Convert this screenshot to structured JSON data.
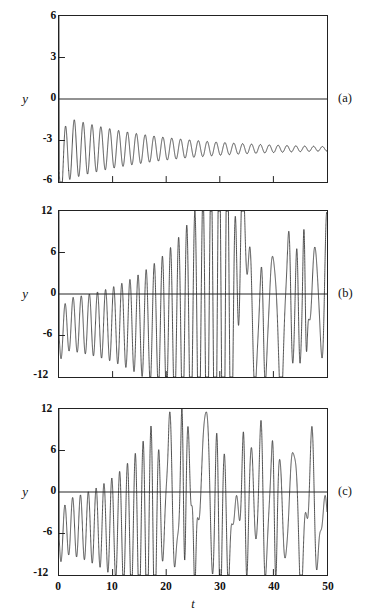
{
  "figure": {
    "background": "#ffffff",
    "line_color": "#222222",
    "axis_color": "#222222",
    "xlabel": "t",
    "ylabel": "y"
  },
  "panels": [
    {
      "letter": "(a)",
      "ylabel": "y",
      "yticks": [
        "6",
        "3",
        "0",
        "-3",
        "-6"
      ],
      "ytick_values": [
        6,
        3,
        0,
        -3,
        -6
      ],
      "ylim": [
        -6,
        6
      ],
      "xlim": [
        0,
        50
      ],
      "xticks_minor": [
        10,
        20,
        30,
        40
      ],
      "show_xticklabels": false
    },
    {
      "letter": "(b)",
      "ylabel": "y",
      "yticks": [
        "12",
        "6",
        "0",
        "-6",
        "-12"
      ],
      "ytick_values": [
        12,
        6,
        0,
        -6,
        -12
      ],
      "ylim": [
        -12,
        12
      ],
      "xlim": [
        0,
        50
      ],
      "xticks_minor": [
        10,
        20,
        30,
        40
      ],
      "show_xticklabels": false
    },
    {
      "letter": "(c)",
      "ylabel": "y",
      "yticks": [
        "12",
        "6",
        "0",
        "-6",
        "-12"
      ],
      "ytick_values": [
        12,
        6,
        0,
        -6,
        -12
      ],
      "ylim": [
        -12,
        12
      ],
      "xlim": [
        0,
        50
      ],
      "xticks": [
        "0",
        "10",
        "20",
        "30",
        "40",
        "50"
      ],
      "xtick_values": [
        0,
        10,
        20,
        30,
        40,
        50
      ],
      "show_xticklabels": true
    }
  ],
  "chart_data": [
    {
      "type": "line",
      "title": "",
      "subtitle": "(a)",
      "xlabel": "",
      "ylabel": "y",
      "xlim": [
        0,
        50
      ],
      "ylim": [
        -6,
        6
      ],
      "grid": false,
      "legend": null,
      "series": [
        {
          "name": "y(t) damped oscillation",
          "description": "Starts at y=6 at t=0, drops sharply, then oscillates about a mean near -3.6 with amplitude decaying from about 2.6 to 0.3 by t=50; period about 1.65",
          "model": {
            "form": "offset + amp0*exp(-k*t)*sin(omega*t + phase)",
            "offset": -3.6,
            "amp0": 2.45,
            "decay_k": 0.055,
            "omega": 3.8,
            "phase": 3.3,
            "initial_spike_y": 6.0,
            "initial_spike_t": 0.05
          }
        }
      ]
    },
    {
      "type": "line",
      "title": "",
      "subtitle": "(b)",
      "xlabel": "",
      "ylabel": "y",
      "xlim": [
        0,
        50
      ],
      "ylim": [
        -12,
        12
      ],
      "grid": false,
      "legend": null,
      "series": [
        {
          "name": "y(t) slowly growing then bursting oscillation",
          "description": "Starts at y=12 at t=0, settles into oscillation about -4.5 with amplitude near 4; envelope grows slowly until about t=33, then large chaotic spikes clipping beyond +/-12 from t=36 to t=50",
          "model": {
            "form": "offset + growing envelope sine, chaotic after onset",
            "offset": -4.4,
            "amp0": 3.6,
            "growth_rate": 0.028,
            "omega": 4.15,
            "phase": 3.2,
            "chaos_onset_t": 33.5,
            "initial_spike_y": 12.0
          }
        }
      ]
    },
    {
      "type": "line",
      "title": "",
      "subtitle": "(c)",
      "xlabel": "t",
      "ylabel": "y",
      "xlim": [
        0,
        50
      ],
      "ylim": [
        -12,
        12
      ],
      "grid": false,
      "legend": null,
      "series": [
        {
          "name": "y(t) early-onset chaotic oscillation",
          "description": "Starts at y=12 at t=0, oscillates about -5 with amplitude near 4, envelope grows faster than panel b; chaotic large-amplitude spikes clipping +/-12 begin near t=20 and continue to t=50",
          "model": {
            "form": "offset + growing envelope sine, chaotic after onset",
            "offset": -5.0,
            "amp0": 3.7,
            "growth_rate": 0.045,
            "omega": 4.3,
            "phase": 3.2,
            "chaos_onset_t": 20.0,
            "initial_spike_y": 12.0
          }
        }
      ]
    }
  ]
}
